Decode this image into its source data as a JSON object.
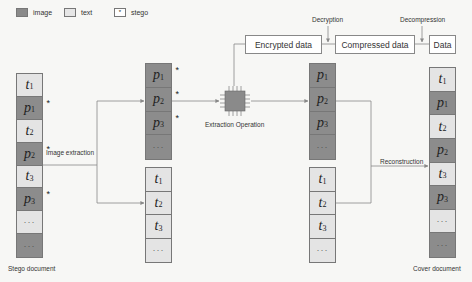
{
  "legend": [
    {
      "key": "image",
      "label": "image"
    },
    {
      "key": "text",
      "label": "text"
    },
    {
      "key": "stego",
      "label": "stego",
      "symbol": "*"
    }
  ],
  "top_flow": {
    "boxes": [
      "Encrypted data",
      "Compressed data",
      "Data"
    ],
    "steps": [
      "Decryption",
      "Decompression"
    ]
  },
  "labels": {
    "image_extraction": "Image extraction",
    "extraction_operation": "Extraction Operation",
    "reconstruction": "Reconstruction",
    "stego_document": "Stego document",
    "cover_document": "Cover document"
  },
  "columns": {
    "stego_document": [
      {
        "type": "text",
        "sym": "t",
        "sub": "1",
        "stego": false
      },
      {
        "type": "image",
        "sym": "p",
        "sub": "1",
        "stego": true
      },
      {
        "type": "text",
        "sym": "t",
        "sub": "2",
        "stego": false
      },
      {
        "type": "image",
        "sym": "p",
        "sub": "2",
        "stego": true
      },
      {
        "type": "text",
        "sym": "t",
        "sub": "3",
        "stego": false
      },
      {
        "type": "image",
        "sym": "p",
        "sub": "3",
        "stego": true
      },
      {
        "type": "text",
        "sym": "…",
        "sub": "",
        "stego": false
      },
      {
        "type": "image",
        "sym": "…",
        "sub": "",
        "stego": false
      }
    ],
    "extracted_images": [
      {
        "type": "image",
        "sym": "p",
        "sub": "1",
        "stego": true
      },
      {
        "type": "image",
        "sym": "p",
        "sub": "2",
        "stego": true
      },
      {
        "type": "image",
        "sym": "p",
        "sub": "3",
        "stego": true
      },
      {
        "type": "image",
        "sym": "…",
        "sub": "",
        "stego": false
      }
    ],
    "extracted_texts": [
      {
        "type": "text",
        "sym": "t",
        "sub": "1",
        "stego": false
      },
      {
        "type": "text",
        "sym": "t",
        "sub": "2",
        "stego": false
      },
      {
        "type": "text",
        "sym": "t",
        "sub": "3",
        "stego": false
      },
      {
        "type": "text",
        "sym": "…",
        "sub": "",
        "stego": false
      }
    ],
    "restored_images": [
      {
        "type": "image",
        "sym": "p",
        "sub": "1",
        "stego": false
      },
      {
        "type": "image",
        "sym": "p",
        "sub": "2",
        "stego": false
      },
      {
        "type": "image",
        "sym": "p",
        "sub": "3",
        "stego": false
      },
      {
        "type": "image",
        "sym": "…",
        "sub": "",
        "stego": false
      }
    ],
    "restored_texts": [
      {
        "type": "text",
        "sym": "t",
        "sub": "1",
        "stego": false
      },
      {
        "type": "text",
        "sym": "t",
        "sub": "2",
        "stego": false
      },
      {
        "type": "text",
        "sym": "t",
        "sub": "3",
        "stego": false
      },
      {
        "type": "text",
        "sym": "…",
        "sub": "",
        "stego": false
      }
    ],
    "cover_document": [
      {
        "type": "text",
        "sym": "t",
        "sub": "1",
        "stego": false
      },
      {
        "type": "image",
        "sym": "p",
        "sub": "1",
        "stego": false
      },
      {
        "type": "text",
        "sym": "t",
        "sub": "2",
        "stego": false
      },
      {
        "type": "image",
        "sym": "p",
        "sub": "2",
        "stego": false
      },
      {
        "type": "text",
        "sym": "t",
        "sub": "3",
        "stego": false
      },
      {
        "type": "image",
        "sym": "p",
        "sub": "3",
        "stego": false
      },
      {
        "type": "text",
        "sym": "…",
        "sub": "",
        "stego": false
      },
      {
        "type": "image",
        "sym": "…",
        "sub": "",
        "stego": false
      }
    ]
  },
  "colors": {
    "image_cell": "#8c8c8c",
    "text_cell": "#e4e4e4",
    "chip": "#8a8a8a",
    "line": "#888888"
  }
}
